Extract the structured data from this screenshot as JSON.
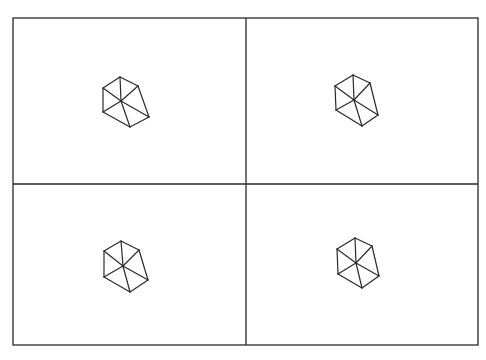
{
  "figure": {
    "width": 486,
    "height": 360,
    "background": "#ffffff",
    "stroke_color": "#2a2a2a",
    "frame": {
      "left": 13,
      "top": 18,
      "right": 478,
      "bottom": 345
    },
    "dividers": {
      "vertical_x": 246,
      "horizontal_y": 184
    }
  },
  "panels": [
    {
      "id": "top-left",
      "shape": "cube-wireframe",
      "vertices": {
        "T": [
          120,
          77
        ],
        "UL": [
          103,
          88
        ],
        "UR": [
          138,
          86
        ],
        "C": [
          121,
          101
        ],
        "LL": [
          103,
          112
        ],
        "BR": [
          149,
          117
        ],
        "B": [
          130,
          127
        ]
      }
    },
    {
      "id": "top-right",
      "shape": "cube-wireframe",
      "vertices": {
        "T": [
          353,
          75
        ],
        "UL": [
          335,
          86
        ],
        "UR": [
          370,
          83
        ],
        "C": [
          354,
          100
        ],
        "LL": [
          336,
          110
        ],
        "BR": [
          378,
          115
        ],
        "B": [
          362,
          126
        ]
      }
    },
    {
      "id": "bottom-left",
      "shape": "cube-wireframe",
      "vertices": {
        "T": [
          121,
          241
        ],
        "UL": [
          104,
          251
        ],
        "UR": [
          139,
          250
        ],
        "C": [
          123,
          266
        ],
        "LL": [
          104,
          277
        ],
        "BR": [
          148,
          280
        ],
        "B": [
          130,
          292
        ]
      }
    },
    {
      "id": "bottom-right",
      "shape": "cube-wireframe",
      "vertices": {
        "T": [
          355,
          238
        ],
        "UL": [
          337,
          249
        ],
        "UR": [
          372,
          246
        ],
        "C": [
          356,
          263
        ],
        "LL": [
          338,
          274
        ],
        "BR": [
          379,
          276
        ],
        "B": [
          362,
          288
        ]
      }
    }
  ],
  "edges": [
    [
      "T",
      "UL"
    ],
    [
      "T",
      "UR"
    ],
    [
      "T",
      "C"
    ],
    [
      "UL",
      "C"
    ],
    [
      "UR",
      "C"
    ],
    [
      "UL",
      "LL"
    ],
    [
      "LL",
      "C"
    ],
    [
      "LL",
      "B"
    ],
    [
      "C",
      "B"
    ],
    [
      "C",
      "BR"
    ],
    [
      "B",
      "BR"
    ],
    [
      "UR",
      "BR"
    ]
  ]
}
